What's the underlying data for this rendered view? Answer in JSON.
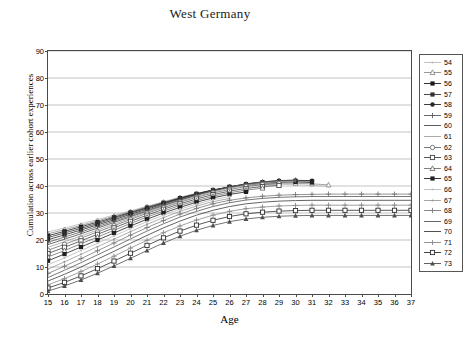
{
  "chart_data": {
    "type": "line",
    "title": "West Germany",
    "xlabel": "Age",
    "ylabel": "Cumulation across earlier cohort experiences",
    "xlim": [
      15,
      37
    ],
    "ylim": [
      0,
      90
    ],
    "xticks": [
      15,
      16,
      17,
      18,
      19,
      20,
      21,
      22,
      23,
      24,
      25,
      26,
      27,
      28,
      29,
      30,
      31,
      32,
      33,
      34,
      35,
      36,
      37
    ],
    "yticks": [
      0,
      10,
      20,
      30,
      40,
      50,
      60,
      70,
      80,
      90
    ],
    "grid": "horizontal",
    "legend_position": "right-outside",
    "legend_title": "",
    "series": [
      {
        "name": "54",
        "marker": "dot",
        "color": "#b9b9b9",
        "x": [
          15,
          16,
          17,
          18,
          19,
          20,
          21,
          22,
          23,
          24,
          25,
          26,
          27,
          28,
          29,
          30,
          31,
          32
        ],
        "values": [
          23.0,
          24.4,
          26.0,
          27.6,
          29.2,
          30.8,
          32.5,
          34.2,
          35.9,
          37.3,
          38.5,
          39.4,
          40.1,
          40.5,
          40.6,
          40.5,
          40.2,
          39.8
        ]
      },
      {
        "name": "55",
        "marker": "triangle-open",
        "color": "#8c8c8c",
        "x": [
          15,
          16,
          17,
          18,
          19,
          20,
          21,
          22,
          23,
          24,
          25,
          26,
          27,
          28,
          29,
          30,
          31,
          32
        ],
        "values": [
          22.3,
          23.8,
          25.4,
          27.1,
          28.8,
          30.5,
          32.3,
          34.0,
          35.7,
          37.2,
          38.5,
          39.5,
          40.3,
          40.8,
          41.0,
          41.0,
          40.8,
          40.4
        ]
      },
      {
        "name": "56",
        "marker": "square-filled",
        "color": "#1a1a1a",
        "x": [
          15,
          16,
          17,
          18,
          19,
          20,
          21,
          22,
          23,
          24,
          25,
          26,
          27,
          28,
          29,
          30,
          31
        ],
        "values": [
          21.6,
          23.2,
          24.9,
          26.6,
          28.4,
          30.2,
          32.0,
          33.8,
          35.5,
          37.1,
          38.5,
          39.6,
          40.5,
          41.1,
          41.4,
          41.5,
          41.3
        ]
      },
      {
        "name": "57",
        "marker": "square-filled",
        "color": "#333333",
        "x": [
          15,
          16,
          17,
          18,
          19,
          20,
          21,
          22,
          23,
          24,
          25,
          26,
          27,
          28,
          29,
          30,
          31
        ],
        "values": [
          20.9,
          22.6,
          24.3,
          26.1,
          28.0,
          29.9,
          31.8,
          33.6,
          35.4,
          37.0,
          38.5,
          39.7,
          40.7,
          41.4,
          41.8,
          41.9,
          41.8
        ]
      },
      {
        "name": "58",
        "marker": "circle-filled",
        "color": "#262626",
        "x": [
          15,
          16,
          17,
          18,
          19,
          20,
          21,
          22,
          23,
          24,
          25,
          26,
          27,
          28,
          29,
          30,
          31
        ],
        "values": [
          20.1,
          21.9,
          23.7,
          25.6,
          27.5,
          29.5,
          31.4,
          33.3,
          35.2,
          36.9,
          38.4,
          39.7,
          40.8,
          41.5,
          42.0,
          42.1,
          42.0
        ]
      },
      {
        "name": "59",
        "marker": "plus",
        "color": "#5a5a5a",
        "x": [
          15,
          16,
          17,
          18,
          19,
          20,
          21,
          22,
          23,
          24,
          25,
          26,
          27,
          28,
          29,
          30
        ],
        "values": [
          19.2,
          21.1,
          23.0,
          25.0,
          27.0,
          29.0,
          31.0,
          33.0,
          34.9,
          36.7,
          38.3,
          39.6,
          40.7,
          41.5,
          42.0,
          42.2
        ]
      },
      {
        "name": "60",
        "marker": "line",
        "color": "#4a4a4a",
        "x": [
          15,
          16,
          17,
          18,
          19,
          20,
          21,
          22,
          23,
          24,
          25,
          26,
          27,
          28,
          29,
          30
        ],
        "values": [
          18.3,
          20.3,
          22.3,
          24.4,
          26.5,
          28.6,
          30.7,
          32.7,
          34.7,
          36.5,
          38.1,
          39.5,
          40.6,
          41.4,
          41.9,
          42.1
        ]
      },
      {
        "name": "61",
        "marker": "none",
        "color": "#a0a0a0",
        "x": [
          15,
          16,
          17,
          18,
          19,
          20,
          21,
          22,
          23,
          24,
          25,
          26,
          27,
          28,
          29,
          30
        ],
        "values": [
          17.3,
          19.4,
          21.5,
          23.7,
          25.9,
          28.1,
          30.3,
          32.4,
          34.4,
          36.2,
          37.8,
          39.2,
          40.3,
          41.1,
          41.6,
          41.8
        ]
      },
      {
        "name": "62",
        "marker": "circle-open",
        "color": "#6e6e6e",
        "x": [
          15,
          16,
          17,
          18,
          19,
          20,
          21,
          22,
          23,
          24,
          25,
          26,
          27,
          28,
          29
        ],
        "values": [
          16.2,
          18.4,
          20.7,
          23.0,
          25.3,
          27.6,
          29.9,
          32.0,
          34.0,
          35.8,
          37.4,
          38.7,
          39.8,
          40.5,
          40.9
        ]
      },
      {
        "name": "63",
        "marker": "square-open",
        "color": "#444444",
        "x": [
          15,
          16,
          17,
          18,
          19,
          20,
          21,
          22,
          23,
          24,
          25,
          26,
          27,
          28,
          29
        ],
        "values": [
          15.0,
          17.3,
          19.7,
          22.1,
          24.5,
          26.9,
          29.2,
          31.4,
          33.4,
          35.2,
          36.8,
          38.1,
          39.1,
          39.8,
          40.2
        ]
      },
      {
        "name": "64",
        "marker": "triangle-open",
        "color": "#707070",
        "x": [
          15,
          16,
          17,
          18,
          19,
          20,
          21,
          22,
          23,
          24,
          25,
          26,
          27,
          28
        ],
        "values": [
          13.7,
          16.1,
          18.6,
          21.1,
          23.6,
          26.1,
          28.5,
          30.7,
          32.8,
          34.6,
          36.2,
          37.5,
          38.5,
          39.2
        ]
      },
      {
        "name": "65",
        "marker": "square-filled",
        "color": "#1f1f1f",
        "x": [
          15,
          16,
          17,
          18,
          19,
          20,
          21,
          22,
          23,
          24,
          25,
          26,
          27
        ],
        "values": [
          12.3,
          14.8,
          17.4,
          20.0,
          22.6,
          25.2,
          27.7,
          30.0,
          32.1,
          34.0,
          35.6,
          36.9,
          37.8
        ]
      },
      {
        "name": "66",
        "marker": "dot",
        "color": "#bdbdbd",
        "x": [
          15,
          16,
          17,
          18,
          19,
          20,
          21,
          22,
          23,
          24,
          25,
          26
        ],
        "values": [
          10.8,
          13.4,
          16.1,
          18.8,
          21.5,
          24.2,
          26.8,
          29.2,
          31.4,
          33.3,
          34.9,
          36.1
        ]
      },
      {
        "name": "67",
        "marker": "dot",
        "color": "#9a9a9a",
        "x": [
          15,
          16,
          17,
          18,
          19,
          20,
          21,
          22,
          23,
          24,
          25,
          26
        ],
        "values": [
          9.2,
          11.9,
          14.7,
          17.5,
          20.3,
          23.1,
          25.8,
          28.3,
          30.6,
          32.6,
          34.2,
          35.4
        ]
      },
      {
        "name": "68",
        "marker": "plus",
        "color": "#7a7a7a",
        "x": [
          15,
          16,
          17,
          18,
          19,
          20,
          21,
          22,
          23,
          24,
          25,
          26,
          27,
          28,
          29,
          30,
          31,
          32,
          33,
          34,
          35,
          36,
          37
        ],
        "values": [
          7.6,
          10.3,
          13.1,
          16.0,
          18.9,
          21.8,
          24.6,
          27.2,
          29.6,
          31.7,
          33.4,
          34.7,
          35.6,
          36.2,
          36.6,
          36.8,
          36.9,
          37.0,
          37.0,
          37.0,
          37.0,
          37.0,
          37.0
        ]
      },
      {
        "name": "69",
        "marker": "line",
        "color": "#555555",
        "x": [
          15,
          16,
          17,
          18,
          19,
          20,
          21,
          22,
          23,
          24,
          25,
          26,
          27,
          28,
          29,
          30,
          31,
          32,
          33,
          34,
          35,
          36,
          37
        ],
        "values": [
          6.1,
          8.8,
          11.6,
          14.5,
          17.4,
          20.4,
          23.3,
          26.0,
          28.5,
          30.6,
          32.4,
          33.8,
          34.8,
          35.4,
          35.8,
          36.0,
          36.1,
          36.1,
          36.1,
          36.1,
          36.1,
          36.1,
          36.1
        ]
      },
      {
        "name": "70",
        "marker": "line",
        "color": "#3c3c3c",
        "x": [
          15,
          16,
          17,
          18,
          19,
          20,
          21,
          22,
          23,
          24,
          25,
          26,
          27,
          28,
          29,
          30,
          31,
          32,
          33,
          34,
          35,
          36,
          37
        ],
        "values": [
          4.8,
          7.3,
          10.0,
          12.9,
          15.8,
          18.8,
          21.7,
          24.5,
          27.0,
          29.2,
          31.0,
          32.4,
          33.4,
          34.0,
          34.4,
          34.6,
          34.7,
          34.7,
          34.7,
          34.7,
          34.7,
          34.7,
          34.7
        ]
      },
      {
        "name": "71",
        "marker": "plus",
        "color": "#8a8a8a",
        "x": [
          15,
          16,
          17,
          18,
          19,
          20,
          21,
          22,
          23,
          24,
          25,
          26,
          27,
          28,
          29,
          30,
          31,
          32,
          33,
          34,
          35,
          36,
          37
        ],
        "values": [
          3.4,
          5.7,
          8.3,
          11.1,
          14.0,
          17.0,
          19.9,
          22.7,
          25.2,
          27.4,
          29.2,
          30.6,
          31.6,
          32.2,
          32.6,
          32.8,
          32.9,
          32.9,
          32.9,
          32.9,
          32.9,
          32.9,
          32.9
        ]
      },
      {
        "name": "72",
        "marker": "square-open",
        "color": "#2e2e2e",
        "x": [
          15,
          16,
          17,
          18,
          19,
          20,
          21,
          22,
          23,
          24,
          25,
          26,
          27,
          28,
          29,
          30,
          31,
          32,
          33,
          34,
          35,
          36,
          37
        ],
        "values": [
          2.2,
          4.3,
          6.7,
          9.4,
          12.2,
          15.1,
          18.0,
          20.8,
          23.3,
          25.5,
          27.3,
          28.7,
          29.7,
          30.3,
          30.7,
          30.9,
          31.0,
          31.0,
          31.0,
          31.0,
          31.0,
          31.0,
          31.0
        ]
      },
      {
        "name": "73",
        "marker": "triangle-filled",
        "color": "#4f4f4f",
        "x": [
          15,
          16,
          17,
          18,
          19,
          20,
          21,
          22,
          23,
          24,
          25,
          26,
          27,
          28,
          29,
          30,
          31,
          32,
          33,
          34,
          35,
          36,
          37
        ],
        "values": [
          1.1,
          3.0,
          5.2,
          7.7,
          10.4,
          13.2,
          16.1,
          18.9,
          21.4,
          23.6,
          25.4,
          26.8,
          27.8,
          28.4,
          28.8,
          29.0,
          29.1,
          29.1,
          29.1,
          29.1,
          29.1,
          29.1,
          29.1
        ]
      }
    ]
  }
}
